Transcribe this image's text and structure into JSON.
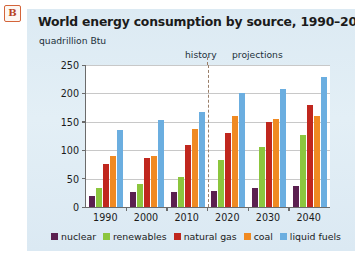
{
  "badge": {
    "label": "B"
  },
  "chart_data": {
    "type": "bar",
    "title": "World energy consumption by source, 1990–2040",
    "xlabel": "",
    "ylabel": "quadrillion Btu",
    "ylim": [
      0,
      250
    ],
    "yticks": [
      0,
      50,
      100,
      150,
      200,
      250
    ],
    "grid": true,
    "legend_position": "bottom",
    "categories": [
      "1990",
      "2000",
      "2010",
      "2020",
      "2030",
      "2040"
    ],
    "series": [
      {
        "name": "nuclear",
        "color": "#5B2050",
        "values": [
          19,
          26,
          26,
          29,
          33,
          37
        ]
      },
      {
        "name": "renewables",
        "color": "#8CC63E",
        "values": [
          33,
          41,
          52,
          82,
          105,
          127
        ]
      },
      {
        "name": "natural gas",
        "color": "#C0271E",
        "values": [
          75,
          87,
          109,
          131,
          149,
          180
        ]
      },
      {
        "name": "coal",
        "color": "#F08A22",
        "values": [
          90,
          90,
          138,
          161,
          155,
          160
        ]
      },
      {
        "name": "liquid fuels",
        "color": "#6BAEE0",
        "values": [
          135,
          153,
          168,
          200,
          207,
          229
        ]
      }
    ],
    "annotations": [
      {
        "name": "history",
        "text": "history"
      },
      {
        "name": "projections",
        "text": "projections"
      }
    ],
    "divider": {
      "position_between": [
        "2010",
        "2020"
      ],
      "style": "dashed"
    }
  }
}
